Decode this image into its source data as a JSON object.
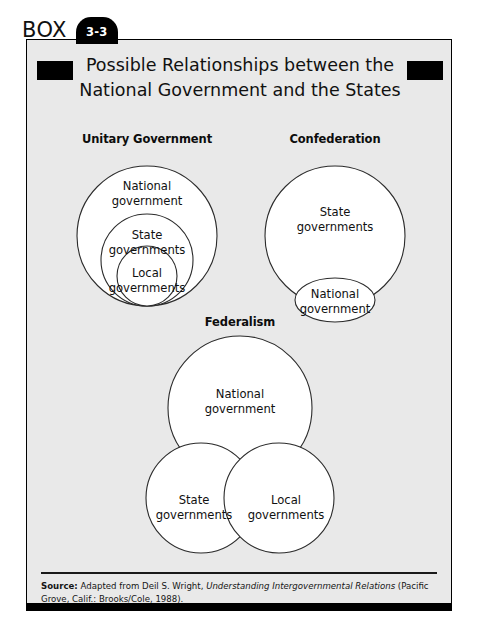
{
  "box": {
    "label": "BOX",
    "number": "3-3"
  },
  "title": {
    "line1": "Possible Relationships between the",
    "line2": "National Government and the States"
  },
  "panels": [
    {
      "id": "unitary",
      "heading": "Unitary Government",
      "type": "nested-circles",
      "labels": {
        "outer_line1": "National",
        "outer_line2": "government",
        "middle_line1": "State",
        "middle_line2": "governments",
        "inner_line1": "Local",
        "inner_line2": "governments"
      }
    },
    {
      "id": "confederation",
      "heading": "Confederation",
      "type": "circle-with-ellipse",
      "labels": {
        "outer_line1": "State",
        "outer_line2": "governments",
        "ellipse_line1": "National",
        "ellipse_line2": "government"
      }
    },
    {
      "id": "federalism",
      "heading": "Federalism",
      "type": "venn-three-circles",
      "labels": {
        "top_line1": "National",
        "top_line2": "government",
        "left_line1": "State",
        "left_line2": "governments",
        "right_line1": "Local",
        "right_line2": "governments"
      }
    }
  ],
  "source": {
    "prefix": "Source:",
    "text_before_italic": " Adapted from Deil S. Wright, ",
    "italic_title": "Understanding Intergovernmental Relations",
    "text_after_italic": " (Pacific Grove, Calif.: Brooks/Cole, 1988)."
  },
  "colors": {
    "ink": "#000000",
    "panel_background": "#e9e9e9",
    "circle_fill": "#ffffff",
    "circle_stroke": "#2b2b2b"
  }
}
